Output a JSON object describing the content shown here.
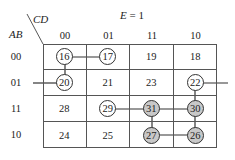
{
  "title": "E = 1",
  "col_var": "CD",
  "row_var": "AB",
  "col_headers": [
    "00",
    "01",
    "11",
    "10"
  ],
  "row_headers": [
    "00",
    "01",
    "11",
    "10"
  ],
  "cells": [
    [
      {
        "v": "16",
        "circle": "white"
      },
      {
        "v": "17",
        "circle": "white"
      },
      {
        "v": "19",
        "circle": "none"
      },
      {
        "v": "18",
        "circle": "none"
      }
    ],
    [
      {
        "v": "20",
        "circle": "white"
      },
      {
        "v": "21",
        "circle": "none"
      },
      {
        "v": "23",
        "circle": "none"
      },
      {
        "v": "22",
        "circle": "white"
      }
    ],
    [
      {
        "v": "28",
        "circle": "none"
      },
      {
        "v": "29",
        "circle": "white"
      },
      {
        "v": "31",
        "circle": "shaded"
      },
      {
        "v": "30",
        "circle": "shaded"
      }
    ],
    [
      {
        "v": "24",
        "circle": "none"
      },
      {
        "v": "25",
        "circle": "none"
      },
      {
        "v": "27",
        "circle": "shaded"
      },
      {
        "v": "26",
        "circle": "shaded"
      }
    ]
  ],
  "connections": [
    [
      "16",
      "17"
    ],
    [
      "16",
      "20"
    ],
    [
      "20",
      "wrap-left"
    ],
    [
      "22",
      "wrap-right"
    ],
    [
      "29",
      "31"
    ],
    [
      "31",
      "30"
    ],
    [
      "31",
      "27"
    ],
    [
      "30",
      "26"
    ],
    [
      "27",
      "26"
    ],
    [
      "22",
      "30"
    ]
  ],
  "colors": {
    "line": "#333333",
    "shaded": "#c8c8c8",
    "grid": "#555555"
  }
}
